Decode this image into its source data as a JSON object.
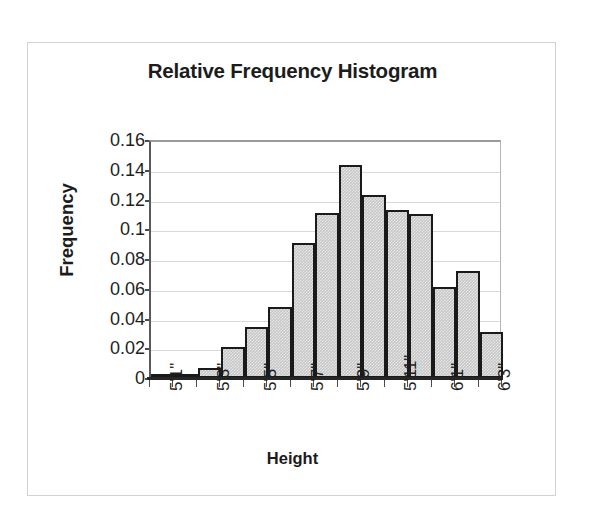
{
  "chart_data": {
    "type": "bar",
    "title": "Relative Frequency Histogram",
    "xlabel": "Height",
    "ylabel": "Frequency",
    "ylim": [
      0,
      0.16
    ],
    "ytick_labels": [
      "0.16",
      "0.14",
      "0.12",
      "0.1",
      "0.08",
      "0.06",
      "0.04",
      "0.02",
      "0"
    ],
    "ytick_values": [
      0.16,
      0.14,
      0.12,
      0.1,
      0.08,
      0.06,
      0.04,
      0.02,
      0
    ],
    "grid": true,
    "legend": false,
    "legend_position": "none",
    "bar_gap": 0,
    "categories": [
      "5'1\"",
      "",
      "5'3\"",
      "",
      "5'5\"",
      "",
      "5'7\"",
      "",
      "5'9\"",
      "",
      "5'11\"",
      "",
      "6'1\"",
      "",
      "6'3\""
    ],
    "tick_labels_shown": [
      "5'1\"",
      "5'3\"",
      "5'5\"",
      "5'7\"",
      "5'9\"",
      "5'11\"",
      "6'1\"",
      "6'3\""
    ],
    "values": [
      0.001,
      0.003,
      0.007,
      0.021,
      0.034,
      0.048,
      0.091,
      0.111,
      0.143,
      0.123,
      0.113,
      0.11,
      0.061,
      0.072,
      0.031
    ],
    "bar_fill_color": "#c6c6c6",
    "bar_border_color": "#1a1a1a",
    "gridline_color": "#d9d9d9",
    "axis_color": "#262626",
    "text_color": "#1e1e1e",
    "background_color": "#ffffff",
    "frame_border_color": "#d2d2d2"
  }
}
